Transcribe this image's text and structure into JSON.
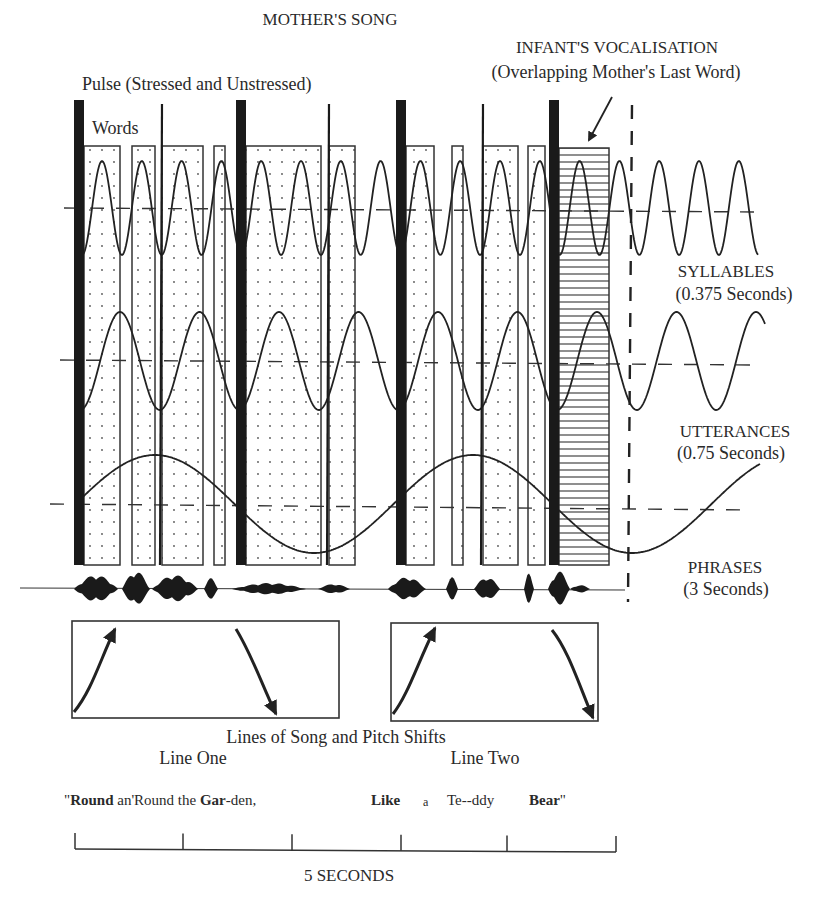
{
  "title": "MOTHER'S SONG",
  "labels": {
    "pulse": "Pulse (Stressed and Unstressed)",
    "words": "Words",
    "infant_line1": "INFANT'S VOCALISATION",
    "infant_line2": "(Overlapping Mother's Last Word)",
    "syllables": "SYLLABLES",
    "syllables_period": "(0.375 Seconds)",
    "utterances": "UTTERANCES",
    "utterances_period": "(0.75 Seconds)",
    "phrases": "PHRASES",
    "phrases_period": "(3 Seconds)",
    "pitch_shifts": "Lines of Song and Pitch Shifts",
    "line_one": "Line One",
    "line_two": "Line Two",
    "time_scale": "5 SECONDS"
  },
  "lyrics": [
    {
      "text": "\"",
      "bold": false
    },
    {
      "text": "Round",
      "bold": true
    },
    {
      "text": " an'Round the ",
      "bold": false
    },
    {
      "text": "Gar",
      "bold": true
    },
    {
      "text": "-den,",
      "bold": false
    },
    {
      "text": "Like",
      "bold": true
    },
    {
      "text": "a",
      "bold": false
    },
    {
      "text": "Te--ddy",
      "bold": false
    },
    {
      "text": "Bear",
      "bold": true
    },
    {
      "text": "\"",
      "bold": false
    }
  ],
  "diagram": {
    "stressed_pulses_x": [
      79,
      241,
      401,
      554
    ],
    "unstressed_pulses_x": [
      162,
      329,
      483
    ],
    "word_boxes": [
      {
        "x1": 84,
        "x2": 120
      },
      {
        "x1": 132,
        "x2": 155
      },
      {
        "x1": 162,
        "x2": 203
      },
      {
        "x1": 214,
        "x2": 225
      },
      {
        "x1": 246,
        "x2": 321
      },
      {
        "x1": 329,
        "x2": 355
      },
      {
        "x1": 406,
        "x2": 434
      },
      {
        "x1": 452,
        "x2": 463
      },
      {
        "x1": 483,
        "x2": 518
      },
      {
        "x1": 528,
        "x2": 545
      }
    ],
    "infant_box": {
      "x1": 559,
      "x2": 609
    },
    "waves": [
      {
        "name": "syllables",
        "period_seconds": 0.375,
        "midline_y": 208,
        "amplitude": 47,
        "period_px": 39.8,
        "peak_x": 102,
        "x_start": 82,
        "x_end": 758
      },
      {
        "name": "utterances",
        "period_seconds": 0.75,
        "midline_y": 361,
        "amplitude": 49,
        "period_px": 79.5,
        "peak_x": 120,
        "x_start": 82,
        "x_end": 765
      },
      {
        "name": "phrases",
        "period_seconds": 3,
        "midline_y": 504,
        "amplitude": 49,
        "period_px": 318,
        "peak_x": 155,
        "x_start": 82,
        "x_end": 760
      }
    ],
    "scale_ticks_x": [
      75,
      183,
      292,
      401,
      507,
      616
    ],
    "scale_seconds": 5
  }
}
